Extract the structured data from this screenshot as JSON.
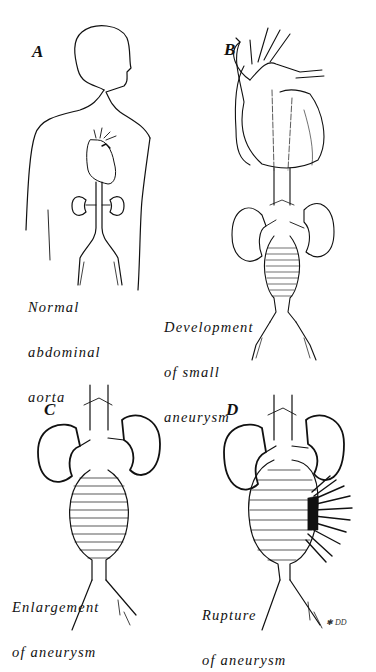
{
  "figure": {
    "panels": [
      {
        "letter": "A",
        "caption_lines": [
          "Normal",
          "abdominal",
          "aorta"
        ]
      },
      {
        "letter": "B",
        "caption_lines": [
          "Development",
          "of small",
          "aneurysm"
        ]
      },
      {
        "letter": "C",
        "caption_lines": [
          "Enlargement",
          "of aneurysm"
        ]
      },
      {
        "letter": "D",
        "caption_lines": [
          "Rupture",
          "of aneurysm"
        ]
      }
    ],
    "signature": "✱ DD"
  }
}
